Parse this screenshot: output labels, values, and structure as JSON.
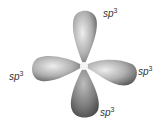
{
  "diagram": {
    "labels": [
      {
        "id": "top",
        "text": "sp",
        "sup": "3"
      },
      {
        "id": "left",
        "text": "sp",
        "sup": "3"
      },
      {
        "id": "right",
        "text": "sp",
        "sup": "3"
      },
      {
        "id": "bottom",
        "text": "sp",
        "sup": "3"
      }
    ],
    "colors": {
      "lobe_light": "#e4e4e4",
      "lobe_mid": "#a8a8a8",
      "lobe_dark": "#5a5a5a",
      "nucleus": "#f4f4f4"
    }
  }
}
